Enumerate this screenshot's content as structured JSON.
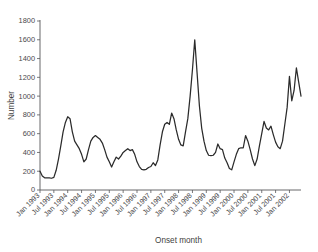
{
  "chart_data": {
    "type": "line",
    "title": "",
    "xlabel": "Onset month",
    "ylabel": "Number",
    "ylim": [
      0,
      1800
    ],
    "ytick_step": 200,
    "grid": false,
    "legend": "none",
    "line_color": "#2b2b2b",
    "axis_color": "#58585a",
    "yticks": [
      "0",
      "200",
      "400",
      "600",
      "800",
      "1000",
      "1200",
      "1400",
      "1600",
      "1800"
    ],
    "xticks": [
      "Jan 1993",
      "Jul 1993",
      "Jan 1994",
      "Jul 1994",
      "Jan 1995",
      "Jul 1995",
      "Jan 1996",
      "Jul 1996",
      "Jan 1997",
      "Jul 1997",
      "Jan 1998",
      "Jul 1998",
      "Jan 1999",
      "Jul 1999",
      "Jan 2000",
      "Jul 2000",
      "Jan 2001",
      "Jul 2001",
      "Jan 2002"
    ],
    "x_start": "Jan 1993",
    "x_end": "Jul 2002",
    "x": [
      "Jan 1993",
      "Feb 1993",
      "Mar 1993",
      "Apr 1993",
      "May 1993",
      "Jun 1993",
      "Jul 1993",
      "Aug 1993",
      "Sep 1993",
      "Oct 1993",
      "Nov 1993",
      "Dec 1993",
      "Jan 1994",
      "Feb 1994",
      "Mar 1994",
      "Apr 1994",
      "May 1994",
      "Jun 1994",
      "Jul 1994",
      "Aug 1994",
      "Sep 1994",
      "Oct 1994",
      "Nov 1994",
      "Dec 1994",
      "Jan 1995",
      "Feb 1995",
      "Mar 1995",
      "Apr 1995",
      "May 1995",
      "Jun 1995",
      "Jul 1995",
      "Aug 1995",
      "Sep 1995",
      "Oct 1995",
      "Nov 1995",
      "Dec 1995",
      "Jan 1996",
      "Feb 1996",
      "Mar 1996",
      "Apr 1996",
      "May 1996",
      "Jun 1996",
      "Jul 1996",
      "Aug 1996",
      "Sep 1996",
      "Oct 1996",
      "Nov 1996",
      "Dec 1996",
      "Jan 1997",
      "Feb 1997",
      "Mar 1997",
      "Apr 1997",
      "May 1997",
      "Jun 1997",
      "Jul 1997",
      "Aug 1997",
      "Sep 1997",
      "Oct 1997",
      "Nov 1997",
      "Dec 1997",
      "Jan 1998",
      "Feb 1998",
      "Mar 1998",
      "Apr 1998",
      "May 1998",
      "Jun 1998",
      "Jul 1998",
      "Aug 1998",
      "Sep 1998",
      "Oct 1998",
      "Nov 1998",
      "Dec 1998",
      "Jan 1999",
      "Feb 1999",
      "Mar 1999",
      "Apr 1999",
      "May 1999",
      "Jun 1999",
      "Jul 1999",
      "Aug 1999",
      "Sep 1999",
      "Oct 1999",
      "Nov 1999",
      "Dec 1999",
      "Jan 2000",
      "Feb 2000",
      "Mar 2000",
      "Apr 2000",
      "May 2000",
      "Jun 2000",
      "Jul 2000",
      "Aug 2000",
      "Sep 2000",
      "Oct 2000",
      "Nov 2000",
      "Dec 2000",
      "Jan 2001",
      "Feb 2001",
      "Mar 2001",
      "Apr 2001",
      "May 2001",
      "Jun 2001",
      "Jul 2001",
      "Aug 2001",
      "Sep 2001",
      "Oct 2001",
      "Nov 2001",
      "Dec 2001",
      "Jan 2002",
      "Feb 2002",
      "Mar 2002",
      "Apr 2002",
      "May 2002",
      "Jun 2002"
    ],
    "values": [
      200,
      150,
      130,
      130,
      130,
      125,
      135,
      210,
      330,
      470,
      620,
      720,
      780,
      760,
      620,
      520,
      480,
      440,
      380,
      300,
      330,
      430,
      520,
      560,
      580,
      560,
      540,
      500,
      430,
      350,
      300,
      245,
      300,
      350,
      330,
      360,
      400,
      420,
      440,
      420,
      430,
      380,
      300,
      250,
      220,
      215,
      220,
      240,
      250,
      290,
      260,
      320,
      480,
      620,
      700,
      720,
      700,
      820,
      760,
      640,
      540,
      480,
      470,
      620,
      760,
      1000,
      1280,
      1600,
      1250,
      900,
      660,
      520,
      420,
      370,
      365,
      370,
      400,
      490,
      440,
      430,
      340,
      290,
      230,
      215,
      300,
      380,
      440,
      450,
      450,
      580,
      520,
      430,
      330,
      260,
      330,
      470,
      600,
      730,
      660,
      640,
      680,
      590,
      510,
      460,
      440,
      520,
      700,
      880,
      1210,
      950,
      1060,
      1300,
      1150,
      1000
    ]
  }
}
